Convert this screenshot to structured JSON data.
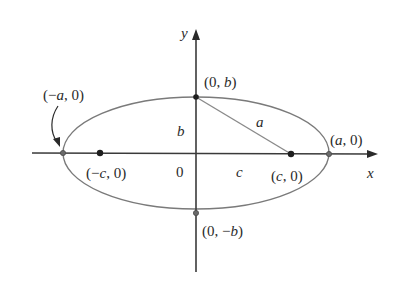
{
  "diagram": {
    "type": "ellipse-foci",
    "axes": {
      "x_label": "x",
      "y_label": "y",
      "origin_label": "0"
    },
    "points": {
      "left_vertex": {
        "label_open": "(",
        "label_sign": "−",
        "label_var": "a",
        "label_rest": ", 0)"
      },
      "right_vertex": {
        "label_open": "(",
        "label_var": "a",
        "label_rest": ", 0)"
      },
      "top_covertex": {
        "label_open": "(0, ",
        "label_var": "b",
        "label_rest": ")"
      },
      "bottom_covertex": {
        "label_open": "(0, −",
        "label_var": "b",
        "label_rest": ")"
      },
      "left_focus": {
        "label_open": "(−",
        "label_var": "c",
        "label_rest": ", 0)"
      },
      "right_focus": {
        "label_open": "(",
        "label_var": "c",
        "label_rest": ", 0)"
      }
    },
    "segments": {
      "semi_minor": "b",
      "focal_distance": "c",
      "hypotenuse": "a"
    },
    "colors": {
      "axis": "#3a3a3a",
      "ellipse": "#7a7a7a",
      "focus_point": "#1e1e1e"
    }
  }
}
